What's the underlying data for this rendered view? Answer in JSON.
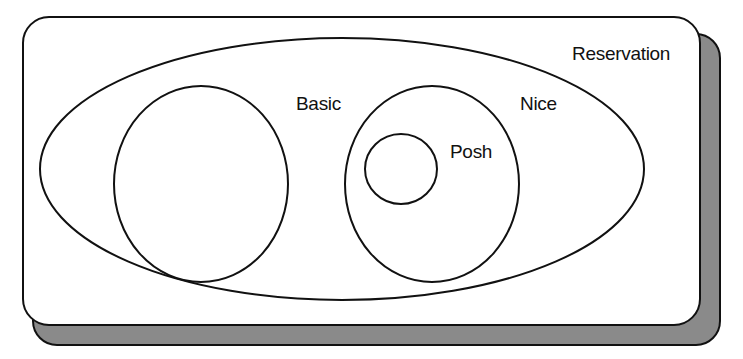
{
  "diagram": {
    "type": "nested-set (Euler) diagram",
    "colors": {
      "background": "#ffffff",
      "card_fill": "#ffffff",
      "shadow_fill": "#8a8a8a",
      "stroke": "#111111"
    },
    "sets": [
      {
        "id": "reservation",
        "label": "Reservation",
        "shape": "rounded-rectangle",
        "contains": [
          "universe-ellipse"
        ]
      },
      {
        "id": "universe-ellipse",
        "label": "",
        "shape": "ellipse",
        "contains": [
          "basic",
          "nice"
        ]
      },
      {
        "id": "basic",
        "label": "Basic",
        "shape": "ellipse",
        "contains": []
      },
      {
        "id": "nice",
        "label": "Nice",
        "shape": "ellipse",
        "contains": [
          "posh"
        ]
      },
      {
        "id": "posh",
        "label": "Posh",
        "shape": "ellipse",
        "contains": []
      }
    ]
  },
  "labels": {
    "reservation": "Reservation",
    "basic": "Basic",
    "nice": "Nice",
    "posh": "Posh"
  }
}
